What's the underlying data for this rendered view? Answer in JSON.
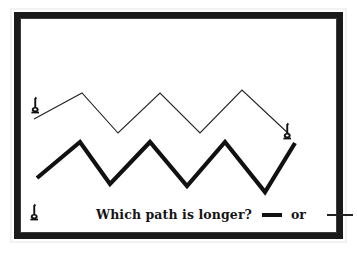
{
  "figure": {
    "background_color": "#ffffff",
    "frame_color": "#1a1a1a",
    "ink_color": "#111111"
  },
  "caption": {
    "question": "Which path is longer?",
    "conjunction": "or",
    "thick_swatch_label": "thick path line sample",
    "thin_swatch_label": "thin path line sample"
  },
  "markers": {
    "start_thin_label": "path start marker top",
    "end_thin_label": "path end marker right",
    "start_thick_label": "path start marker bottom",
    "glyph": "pawn-post"
  },
  "chart_data": {
    "type": "line",
    "title": "Which path is longer?",
    "xlabel": "",
    "ylabel": "",
    "grid": false,
    "legend_position": "bottom-right",
    "xlim": [
      0,
      357
    ],
    "ylim": [
      253,
      0
    ],
    "series": [
      {
        "name": "thin path",
        "style": "thin",
        "color": "#222222",
        "line_width": 1.1,
        "points": [
          [
            34,
            119
          ],
          [
            82,
            93
          ],
          [
            118,
            133
          ],
          [
            160,
            93
          ],
          [
            200,
            133
          ],
          [
            242,
            90
          ],
          [
            290,
            135
          ]
        ]
      },
      {
        "name": "thick path",
        "style": "thick",
        "color": "#111111",
        "line_width": 4.2,
        "points": [
          [
            37,
            178
          ],
          [
            80,
            142
          ],
          [
            110,
            184
          ],
          [
            150,
            142
          ],
          [
            187,
            186
          ],
          [
            225,
            142
          ],
          [
            265,
            192
          ],
          [
            295,
            143
          ]
        ]
      }
    ]
  }
}
